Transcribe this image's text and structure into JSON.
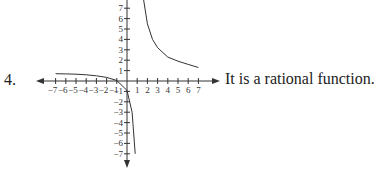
{
  "problem": {
    "number": "4.",
    "statement": "It is a rational function."
  },
  "chart_data": {
    "type": "line",
    "title": "",
    "xlabel": "",
    "ylabel": "",
    "xlim": [
      -8,
      8
    ],
    "ylim": [
      -8,
      8
    ],
    "grid": false,
    "x_tick_labels": [
      "-7",
      "-6",
      "-5",
      "-4",
      "-3",
      "-2",
      "-1",
      "1",
      "2",
      "3",
      "4",
      "5",
      "6",
      "7"
    ],
    "y_tick_labels": [
      "7",
      "6",
      "5",
      "4",
      "3",
      "2",
      "1",
      "-1",
      "-2",
      "-3",
      "-4",
      "-5",
      "-6",
      "-7"
    ],
    "asymptotes": {
      "vertical_x": 1,
      "horizontal_y": 1
    },
    "series": [
      {
        "name": "left branch",
        "x": [
          -7,
          -6,
          -5,
          -4,
          -3,
          -2,
          -1,
          0,
          0.5,
          0.8
        ],
        "y": [
          0.7,
          0.68,
          0.65,
          0.6,
          0.5,
          0.35,
          0.05,
          -0.9,
          -3,
          -7
        ]
      },
      {
        "name": "right branch",
        "x": [
          1.6,
          2,
          2.5,
          3,
          4,
          5,
          6,
          7
        ],
        "y": [
          8,
          5.5,
          4,
          3.2,
          2.3,
          1.9,
          1.6,
          1.3
        ]
      }
    ]
  }
}
